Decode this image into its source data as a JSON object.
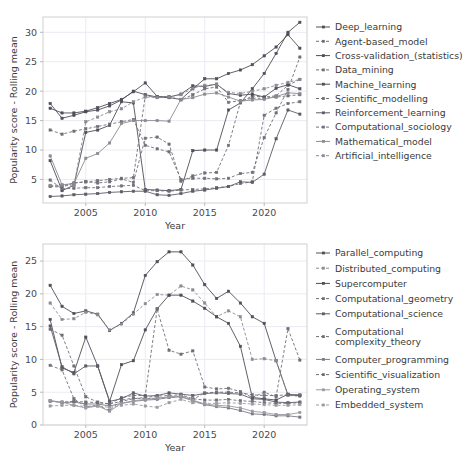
{
  "figure": {
    "width": 474,
    "height": 471,
    "background": "#ffffff",
    "panel_count": 2
  },
  "chart_data": [
    {
      "id": "top",
      "type": "line",
      "title": "",
      "xlabel": "Year",
      "ylabel": "Popularity score - Rolling mean",
      "xlim": [
        2001.4,
        2023.6
      ],
      "ylim": [
        1.0,
        32.6
      ],
      "xticks": [
        2005,
        2010,
        2015,
        2020
      ],
      "yticks": [
        5,
        10,
        15,
        20,
        25,
        30
      ],
      "grid": true,
      "legend_position": "right",
      "x": [
        2002,
        2003,
        2004,
        2005,
        2006,
        2007,
        2008,
        2009,
        2010,
        2011,
        2012,
        2013,
        2014,
        2015,
        2016,
        2017,
        2018,
        2019,
        2020,
        2021,
        2022,
        2023
      ],
      "series": [
        {
          "name": "Deep_learning",
          "linestyle": "solid",
          "color": "#4e4e58",
          "values": [
            8.2,
            3.1,
            4.0,
            13.0,
            13.4,
            14.2,
            18.2,
            18.0,
            3.3,
            3.2,
            3.1,
            3.3,
            9.9,
            10.0,
            10.0,
            16.8,
            18.0,
            20.4,
            23.0,
            26.4,
            30.0,
            31.7
          ]
        },
        {
          "name": "Agent-based_model",
          "linestyle": "dashed",
          "color": "#6f6f78",
          "values": [
            13.4,
            12.7,
            13.2,
            13.6,
            14.0,
            14.4,
            14.8,
            15.2,
            10.8,
            10.2,
            9.7,
            5.0,
            5.2,
            5.2,
            5.1,
            5.2,
            6.0,
            6.2,
            12.1,
            16.3,
            20.3,
            25.8
          ]
        },
        {
          "name": "Cross-validation_(statistics)",
          "linestyle": "solid",
          "color": "#4e4e58",
          "values": [
            17.9,
            15.4,
            15.9,
            16.5,
            16.8,
            17.5,
            18.5,
            20.0,
            19.4,
            19.0,
            18.9,
            18.6,
            20.4,
            22.1,
            22.1,
            23.0,
            23.6,
            24.5,
            26.0,
            27.5,
            29.6,
            27.3
          ]
        },
        {
          "name": "Data_mining",
          "linestyle": "dashed",
          "color": "#6f6f78",
          "values": [
            3.8,
            3.7,
            4.4,
            4.6,
            4.4,
            4.6,
            5.1,
            4.5,
            12.0,
            12.2,
            11.0,
            4.7,
            5.6,
            6.1,
            6.2,
            10.8,
            18.1,
            19.2,
            19.0,
            19.2,
            21.0,
            22.0
          ]
        },
        {
          "name": "Machine_learning",
          "linestyle": "solid",
          "color": "#4e4e58",
          "values": [
            17.1,
            16.3,
            16.3,
            16.6,
            17.2,
            17.9,
            18.6,
            19.9,
            21.4,
            19.1,
            19.0,
            19.5,
            20.9,
            20.8,
            21.2,
            19.6,
            19.3,
            19.5,
            19.0,
            20.5,
            21.1,
            20.4
          ]
        },
        {
          "name": "Scientific_modelling",
          "linestyle": "dashed",
          "color": "#6f6f78",
          "values": [
            4.9,
            3.4,
            3.5,
            3.6,
            3.6,
            3.8,
            3.9,
            4.0,
            3.1,
            3.1,
            3.0,
            3.2,
            3.3,
            3.4,
            3.6,
            3.8,
            4.3,
            4.6,
            15.9,
            17.1,
            17.9,
            18.2
          ]
        },
        {
          "name": "Reinforcement_learning",
          "linestyle": "solid",
          "color": "#5c5c66",
          "values": [
            2.1,
            2.2,
            2.4,
            2.5,
            2.6,
            2.8,
            2.9,
            3.0,
            3.0,
            2.4,
            2.3,
            2.6,
            3.0,
            3.2,
            3.5,
            3.8,
            4.6,
            4.5,
            5.9,
            11.9,
            16.8,
            16.1
          ]
        },
        {
          "name": "Computational_sociology",
          "linestyle": "dashed",
          "color": "#6f6f78",
          "values": [
            3.9,
            3.9,
            4.4,
            4.6,
            4.8,
            5.0,
            5.2,
            5.3,
            19.2,
            19.0,
            19.1,
            18.5,
            19.4,
            20.4,
            20.7,
            18.1,
            18.4,
            18.8,
            18.8,
            19.0,
            19.2,
            19.4
          ]
        },
        {
          "name": "Mathematical_model",
          "linestyle": "solid",
          "color": "#8a8a92",
          "values": [
            9.0,
            4.1,
            4.3,
            8.6,
            9.4,
            11.2,
            14.5,
            15.0,
            15.0,
            15.0,
            14.9,
            18.6,
            18.9,
            19.5,
            19.7,
            19.0,
            18.3,
            18.5,
            18.6,
            19.1,
            19.7,
            19.6
          ]
        },
        {
          "name": "Artificial_intelligence",
          "linestyle": "dashed",
          "color": "#8a8a92",
          "values": [
            4.0,
            4.0,
            3.9,
            14.8,
            15.6,
            16.5,
            17.0,
            18.2,
            19.0,
            18.9,
            19.0,
            19.4,
            20.5,
            21.0,
            21.1,
            19.8,
            19.6,
            20.0,
            20.4,
            21.0,
            21.5,
            22.0
          ]
        }
      ]
    },
    {
      "id": "bottom",
      "type": "line",
      "title": "",
      "xlabel": "Year",
      "ylabel": "Popularity score - Rolling mean",
      "xlim": [
        2001.4,
        2023.6
      ],
      "ylim": [
        0.0,
        27.6
      ],
      "xticks": [
        2005,
        2010,
        2015,
        2020
      ],
      "yticks": [
        0,
        5,
        10,
        15,
        20,
        25
      ],
      "grid": true,
      "legend_position": "right",
      "x": [
        2002,
        2003,
        2004,
        2005,
        2006,
        2007,
        2008,
        2009,
        2010,
        2011,
        2012,
        2013,
        2014,
        2015,
        2016,
        2017,
        2018,
        2019,
        2020,
        2021,
        2022,
        2023
      ],
      "series": [
        {
          "name": "Parallel_computing",
          "linestyle": "solid",
          "color": "#4e4e58",
          "values": [
            21.3,
            18.1,
            17.0,
            17.4,
            16.9,
            14.4,
            15.5,
            17.1,
            22.8,
            24.9,
            26.4,
            26.4,
            24.4,
            21.4,
            19.3,
            20.4,
            18.6,
            16.5,
            15.5,
            9.8,
            4.6,
            4.5
          ]
        },
        {
          "name": "Distributed_computing",
          "linestyle": "dashed",
          "color": "#8a8a92",
          "values": [
            18.6,
            16.1,
            16.2,
            17.2,
            16.8,
            14.5,
            15.4,
            16.9,
            18.5,
            19.9,
            19.8,
            21.2,
            20.6,
            18.6,
            16.5,
            17.4,
            16.5,
            10.0,
            10.1,
            9.8,
            4.5,
            4.4
          ]
        },
        {
          "name": "Supercomputer",
          "linestyle": "solid",
          "color": "#4e4e58",
          "values": [
            16.1,
            8.7,
            8.0,
            13.4,
            9.0,
            3.6,
            9.2,
            9.8,
            14.5,
            17.7,
            19.8,
            19.8,
            18.9,
            17.8,
            16.5,
            15.5,
            12.0,
            4.2,
            4.0,
            3.8,
            4.7,
            4.5
          ]
        },
        {
          "name": "Computational_geometry",
          "linestyle": "dashed",
          "color": "#6f6f78",
          "values": [
            14.6,
            13.7,
            9.0,
            4.3,
            3.5,
            3.2,
            4.2,
            4.5,
            4.5,
            17.7,
            11.4,
            10.8,
            11.3,
            5.8,
            5.5,
            5.6,
            5.1,
            4.2,
            5.0,
            4.3,
            14.7,
            9.9
          ]
        },
        {
          "name": "Computational_science",
          "linestyle": "solid",
          "color": "#5c5c66",
          "values": [
            15.1,
            8.9,
            7.8,
            9.0,
            9.0,
            3.6,
            4.0,
            4.9,
            4.4,
            4.5,
            4.9,
            4.7,
            4.5,
            4.8,
            4.9,
            4.8,
            4.7,
            4.0,
            3.9,
            3.5,
            3.4,
            3.5
          ]
        },
        {
          "name": "Computational complexity_theory",
          "linestyle": "dashed",
          "color": "#6f6f78",
          "values": [
            9.1,
            8.4,
            4.0,
            2.8,
            3.0,
            2.2,
            3.8,
            4.1,
            4.0,
            4.1,
            4.2,
            4.4,
            3.9,
            4.9,
            5.0,
            5.0,
            4.9,
            4.6,
            4.5,
            4.5,
            4.6,
            4.6
          ]
        },
        {
          "name": "Computer_programming",
          "linestyle": "solid",
          "color": "#7a7a84",
          "values": [
            3.7,
            3.4,
            3.5,
            3.2,
            3.2,
            2.9,
            3.3,
            3.6,
            3.8,
            3.9,
            4.2,
            4.3,
            3.7,
            3.1,
            2.8,
            2.6,
            2.2,
            1.7,
            1.6,
            1.4,
            1.4,
            1.2
          ]
        },
        {
          "name": "Scientific_visualization",
          "linestyle": "dashed",
          "color": "#6f6f78",
          "values": [
            3.6,
            3.5,
            3.6,
            3.5,
            3.4,
            3.2,
            3.6,
            4.0,
            4.2,
            4.4,
            4.5,
            4.6,
            4.0,
            3.8,
            3.8,
            3.9,
            3.7,
            3.6,
            3.4,
            3.3,
            3.3,
            3.4
          ]
        },
        {
          "name": "Operating_system",
          "linestyle": "solid",
          "color": "#9a9aa2",
          "values": [
            3.7,
            3.5,
            3.0,
            2.6,
            2.9,
            2.1,
            3.3,
            3.7,
            3.9,
            4.1,
            4.3,
            4.4,
            3.8,
            3.2,
            3.0,
            2.9,
            2.6,
            2.1,
            1.9,
            1.6,
            1.6,
            1.9
          ]
        },
        {
          "name": "Embedded_system",
          "linestyle": "dashed",
          "color": "#9a9aa2",
          "values": [
            2.9,
            3.0,
            3.0,
            2.8,
            2.9,
            2.7,
            3.0,
            3.2,
            2.9,
            2.7,
            3.4,
            3.9,
            3.4,
            3.3,
            3.3,
            3.4,
            3.3,
            3.2,
            3.1,
            3.0,
            3.0,
            3.1
          ]
        }
      ]
    }
  ]
}
